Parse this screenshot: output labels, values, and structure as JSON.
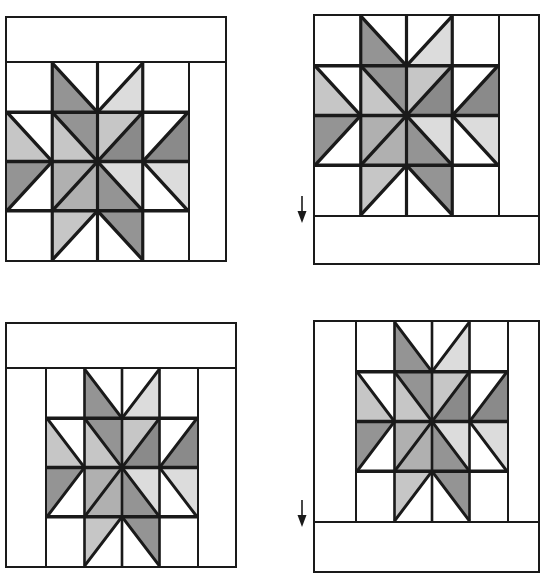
{
  "figure": {
    "panel_count": 4
  },
  "colors": {
    "ink": "#1a1a1a",
    "background": "#ffffff",
    "shade_light": "#dcdcdc",
    "shade_mid_light": "#c6c6c6",
    "shade_mid": "#b0b0b0",
    "shade_dark": "#949494",
    "shade_darkest": "#8a8a8a"
  },
  "block": {
    "grid_label": "4 x 4 patch star block",
    "star_name": "eight-pointed star",
    "star_points": [
      {
        "position": "top-left",
        "shade": "shade_dark"
      },
      {
        "position": "top-right",
        "shade": "shade_light"
      },
      {
        "position": "right-upper",
        "shade": "shade_darkest"
      },
      {
        "position": "right-lower",
        "shade": "shade_light"
      },
      {
        "position": "bottom-right",
        "shade": "shade_dark"
      },
      {
        "position": "bottom-left",
        "shade": "shade_mid_light"
      },
      {
        "position": "left-lower",
        "shade": "shade_dark"
      },
      {
        "position": "left-upper",
        "shade": "shade_mid_light"
      }
    ],
    "center_diamonds": [
      {
        "position": "n-w",
        "shade": "shade_dark"
      },
      {
        "position": "n-e",
        "shade": "shade_mid_light"
      },
      {
        "position": "e-n",
        "shade": "shade_darkest"
      },
      {
        "position": "e-s",
        "shade": "shade_light"
      },
      {
        "position": "s-e",
        "shade": "shade_dark"
      },
      {
        "position": "s-w",
        "shade": "shade_mid"
      },
      {
        "position": "w-s",
        "shade": "shade_mid"
      },
      {
        "position": "w-n",
        "shade": "shade_mid_light"
      }
    ]
  },
  "panels": [
    {
      "id": "panel-1",
      "name": "step-1-top-border",
      "step": "1",
      "border_top": true,
      "border_bottom": false,
      "border_left": false,
      "border_right": true,
      "arrow": false,
      "arrow_label": ""
    },
    {
      "id": "panel-2",
      "name": "step-2-bottom-border",
      "step": "2",
      "border_top": false,
      "border_bottom": true,
      "border_left": false,
      "border_right": true,
      "arrow": true,
      "arrow_label": "added border"
    },
    {
      "id": "panel-3",
      "name": "step-3-left-and-top-border",
      "step": "3",
      "border_top": true,
      "border_bottom": false,
      "border_left": true,
      "border_right": true,
      "arrow": false,
      "arrow_label": ""
    },
    {
      "id": "panel-4",
      "name": "step-4-left-and-bottom-border",
      "step": "4",
      "border_top": false,
      "border_bottom": true,
      "border_left": true,
      "border_right": true,
      "arrow": true,
      "arrow_label": "added border"
    }
  ]
}
